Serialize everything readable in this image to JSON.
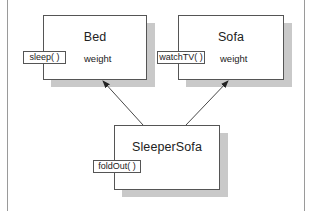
{
  "diagram": {
    "type": "class-inheritance",
    "classes": [
      {
        "name": "Bed",
        "attribute": "weight",
        "method": "sleep( )"
      },
      {
        "name": "Sofa",
        "attribute": "weight",
        "method": "watchTV( )"
      },
      {
        "name": "SleeperSofa",
        "attribute": "",
        "method": "foldOut( )"
      }
    ],
    "relationships": [
      {
        "from": "SleeperSofa",
        "to": "Bed",
        "kind": "inherits"
      },
      {
        "from": "SleeperSofa",
        "to": "Sofa",
        "kind": "inherits"
      }
    ]
  }
}
